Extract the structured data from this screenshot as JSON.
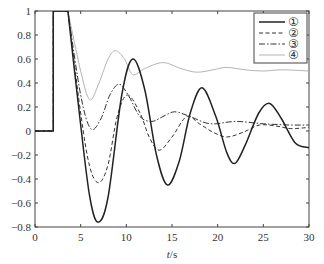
{
  "chart_data": {
    "type": "line",
    "title": "",
    "xlabel": "t/s",
    "xlabel_italic_part": "t",
    "xlabel_rest": "/s",
    "ylabel": "",
    "xlim": [
      0,
      30
    ],
    "ylim": [
      -0.8,
      1
    ],
    "xticks": [
      0,
      5,
      10,
      15,
      20,
      25,
      30
    ],
    "xtick_labels": [
      "0",
      "5",
      "10",
      "15",
      "20",
      "25",
      "30"
    ],
    "yticks": [
      -0.8,
      -0.6,
      -0.4,
      -0.2,
      0,
      0.2,
      0.4,
      0.6,
      0.8,
      1
    ],
    "ytick_labels": [
      "−0.8",
      "−0.6",
      "−0.4",
      "−0.2",
      "0",
      "0.2",
      "0.4",
      "0.6",
      "0.8",
      "1"
    ],
    "grid": false,
    "legend_position": "top-right",
    "series": [
      {
        "name": "①",
        "style": "solid",
        "color": "#222222",
        "x": [
          0,
          2,
          2,
          3.6,
          5,
          6,
          6.9,
          8,
          9.5,
          10.7,
          12,
          13.3,
          14.5,
          15.8,
          17,
          18.3,
          19.8,
          21,
          21.9,
          23,
          24.5,
          25.7,
          27,
          28.5,
          30
        ],
        "y": [
          0,
          0,
          1,
          1,
          0.05,
          -0.55,
          -0.76,
          -0.55,
          0.3,
          0.6,
          0.35,
          -0.2,
          -0.45,
          -0.25,
          0.15,
          0.36,
          0.12,
          -0.18,
          -0.27,
          -0.12,
          0.15,
          0.23,
          0.1,
          -0.1,
          -0.14
        ]
      },
      {
        "name": "②",
        "style": "dashed",
        "color": "#333333",
        "x": [
          0,
          2,
          2,
          3.6,
          5,
          6,
          7,
          8,
          9,
          10.1,
          11.5,
          12.5,
          13.6,
          15,
          16.6,
          18,
          19.5,
          21,
          22.8,
          24.6,
          26.5,
          28,
          30
        ],
        "y": [
          0,
          0,
          1,
          1,
          0.15,
          -0.3,
          -0.43,
          -0.28,
          0.12,
          0.3,
          0.15,
          -0.05,
          -0.16,
          -0.05,
          0.12,
          0.06,
          -0.01,
          -0.05,
          -0.01,
          0.05,
          0.04,
          0.02,
          0.03
        ]
      },
      {
        "name": "③",
        "style": "dashdot",
        "color": "#333333",
        "x": [
          0,
          2,
          2,
          3.6,
          5,
          6.1,
          7.2,
          8.2,
          9.2,
          10.2,
          11.5,
          12.8,
          14,
          15.3,
          17,
          19.2,
          22,
          25,
          28,
          30
        ],
        "y": [
          0,
          0,
          1,
          1,
          0.3,
          0.02,
          0.1,
          0.3,
          0.39,
          0.3,
          0.12,
          0.08,
          0.12,
          0.16,
          0.12,
          0.06,
          0.08,
          0.06,
          0.05,
          0.05
        ]
      },
      {
        "name": "④",
        "style": "solid-thin",
        "color": "#aaaaaa",
        "x": [
          0,
          2,
          2,
          3.6,
          5,
          6,
          7,
          8,
          8.8,
          9.8,
          10.7,
          12,
          14,
          16,
          17.7,
          19.5,
          21,
          23,
          25,
          27,
          30
        ],
        "y": [
          0,
          0,
          1,
          1,
          0.5,
          0.26,
          0.4,
          0.6,
          0.67,
          0.6,
          0.47,
          0.52,
          0.57,
          0.52,
          0.49,
          0.51,
          0.53,
          0.51,
          0.5,
          0.51,
          0.5
        ]
      }
    ]
  }
}
